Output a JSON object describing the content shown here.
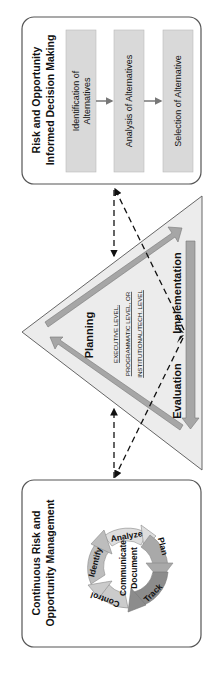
{
  "decision_box": {
    "title_line1": "Risk and Opportunity",
    "title_line2": "Informed Decision Making",
    "steps": [
      {
        "line1": "Identification of",
        "line2": "Alternatives"
      },
      {
        "line1": "Analysis of Alternatives",
        "line2": ""
      },
      {
        "line1": "Selection of Alternative",
        "line2": ""
      }
    ]
  },
  "triangle": {
    "planning": "Planning",
    "implementation": "Implementation",
    "evaluation": "Evaluation",
    "levels": [
      "EXECUTIVE LEVEL,",
      "PROGRAMMATIC LEVEL, OR",
      "INSTITUTIONAL/TECH. LEVEL"
    ]
  },
  "management_box": {
    "title_line1": "Continuous Risk and",
    "title_line2": "Opportunity Management",
    "cycle": [
      "Analyze",
      "Plan",
      "Track",
      "Control",
      "Identify"
    ],
    "center_line1": "Communicate",
    "center_line2": "Document"
  },
  "colors": {
    "box_border": "#555555",
    "step_fill": "#d9d9d9",
    "triangle_fill": "#ececec",
    "bar_fill": "#a6a6a6",
    "analyze": "#dedede",
    "plan": "#a9a9a9",
    "track": "#8c8c8c",
    "control": "#cbcbcb",
    "identify": "#bdbdbd"
  }
}
